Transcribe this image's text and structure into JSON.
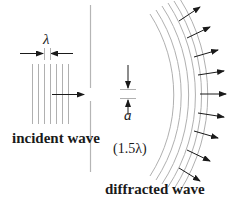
{
  "labels": {
    "wavelength_symbol": "λ",
    "incident_wave": "incident wave",
    "slit_width_symbol": "a",
    "slit_width_value": "(1.5λ)",
    "diffracted_wave": "diffracted wave"
  },
  "colors": {
    "wave_lines": "#b0b0b0",
    "barrier": "#b5b5b5",
    "arrows": "#1a1a1a",
    "text": "#1a1a1a"
  }
}
